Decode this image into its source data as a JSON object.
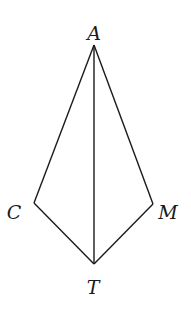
{
  "diagram": {
    "type": "kite-quadrilateral",
    "points": {
      "A": {
        "label": "A",
        "x": 94,
        "y": 45,
        "lx": 94,
        "ly": 40
      },
      "C": {
        "label": "C",
        "x": 34,
        "y": 203,
        "lx": 14,
        "ly": 219
      },
      "M": {
        "label": "M",
        "x": 153,
        "y": 204,
        "lx": 168,
        "ly": 219
      },
      "T": {
        "label": "T",
        "x": 94,
        "y": 264,
        "lx": 93,
        "ly": 294
      }
    },
    "segments": [
      [
        "A",
        "C"
      ],
      [
        "C",
        "T"
      ],
      [
        "T",
        "M"
      ],
      [
        "M",
        "A"
      ],
      [
        "A",
        "T"
      ]
    ],
    "stroke_color": "#1a1a1a"
  }
}
